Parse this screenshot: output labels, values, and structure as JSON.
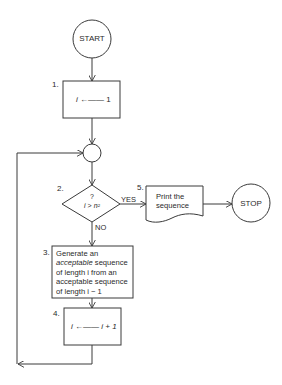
{
  "nodes": {
    "start": {
      "label": "START"
    },
    "step1": {
      "number": "1.",
      "var": "i",
      "arrow": "←——",
      "value": "1"
    },
    "junction": {},
    "step2": {
      "number": "2.",
      "question": "?",
      "var": "i",
      "op": ">",
      "rhs": "n²",
      "yes": "YES",
      "no": "NO"
    },
    "step3": {
      "number": "3.",
      "line1": "Generate an",
      "line2_italic": "acceptable",
      "line2_rest": " sequence",
      "line3": "of length i from an",
      "line4": "acceptable sequence",
      "line5": "of length i − 1"
    },
    "step4": {
      "number": "4.",
      "var": "i",
      "arrow": "←——",
      "value": "i + 1"
    },
    "step5": {
      "number": "5.",
      "line1": "Print the",
      "line2": "sequence"
    },
    "stop": {
      "label": "STOP"
    }
  },
  "colors": {
    "stroke": "#3a3a3a",
    "text": "#2a2a2a",
    "background": "#ffffff"
  }
}
